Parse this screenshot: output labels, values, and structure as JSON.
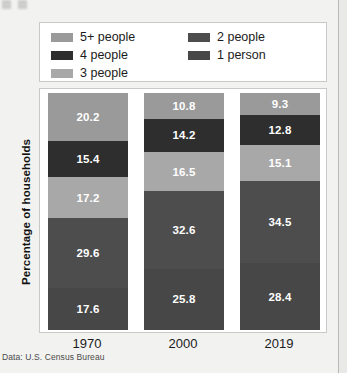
{
  "chart_data": {
    "type": "bar",
    "subtype": "stacked-100-percent",
    "title": "",
    "xlabel": "",
    "ylabel": "Percentage of households",
    "categories": [
      "1970",
      "2000",
      "2019"
    ],
    "ylim": [
      0,
      100
    ],
    "grid": false,
    "legend_position": "top",
    "source_note": "Data: U.S. Census Bureau",
    "series": [
      {
        "name": "5+ people",
        "color": "#9a9a9a",
        "text_color": "#ffffff",
        "values": [
          20.2,
          10.8,
          9.3
        ]
      },
      {
        "name": "4 people",
        "color": "#2e2e2e",
        "text_color": "#ffffff",
        "values": [
          15.4,
          14.2,
          12.8
        ]
      },
      {
        "name": "3 people",
        "color": "#a8a8a8",
        "text_color": "#ffffff",
        "values": [
          17.2,
          16.5,
          15.1
        ]
      },
      {
        "name": "2 people",
        "color": "#4d4d4d",
        "text_color": "#ffffff",
        "values": [
          29.6,
          32.6,
          34.5
        ]
      },
      {
        "name": "1 person",
        "color": "#474747",
        "text_color": "#ffffff",
        "values": [
          17.6,
          25.8,
          28.4
        ]
      }
    ]
  },
  "legend": {
    "columns": [
      [
        {
          "label": "5+ people",
          "color": "#9a9a9a"
        },
        {
          "label": "4 people",
          "color": "#2e2e2e"
        },
        {
          "label": "3 people",
          "color": "#a8a8a8"
        }
      ],
      [
        {
          "label": "2 people",
          "color": "#4d4d4d"
        },
        {
          "label": "1 person",
          "color": "#474747"
        }
      ]
    ]
  },
  "axes": {
    "y_title": "Percentage of households",
    "x_tick_labels": [
      "1970",
      "2000",
      "2019"
    ]
  },
  "caption": {
    "source": "Data: U.S. Census Bureau"
  },
  "colors": {
    "page_background": "#f2f2f0",
    "panel_background": "#ffffff",
    "panel_border": "#c9c9c7",
    "text": "#1b1b1b"
  }
}
